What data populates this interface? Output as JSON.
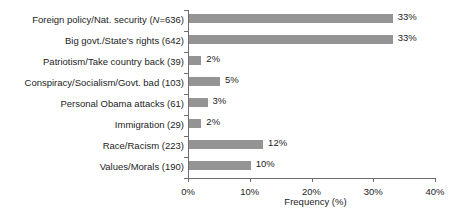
{
  "chart_data": {
    "type": "bar",
    "orientation": "horizontal",
    "title": "",
    "xlabel": "Frequency (%)",
    "ylabel": "",
    "xlim": [
      0,
      40
    ],
    "xticks": [
      "0%",
      "10%",
      "20%",
      "30%",
      "40%"
    ],
    "xtick_values": [
      0,
      10,
      20,
      30,
      40
    ],
    "grid": false,
    "legend": null,
    "bar_color": "#949494",
    "axis_color": "#6e6e6e",
    "text_color": "#1d1d1d",
    "categories": [
      "Foreign policy/Nat. security (N=636)",
      "Big govt./State's rights (642)",
      "Patriotism/Take country back (39)",
      "Conspiracy/Socialism/Govt. bad (103)",
      "Personal Obama attacks (61)",
      "Immigration (29)",
      "Race/Racism (223)",
      "Values/Morals (190)"
    ],
    "values": [
      33,
      33,
      2,
      5,
      3,
      2,
      12,
      10
    ],
    "value_labels": [
      "33%",
      "33%",
      "2%",
      "5%",
      "3%",
      "2%",
      "12%",
      "10%"
    ],
    "counts": [
      636,
      642,
      39,
      103,
      61,
      29,
      223,
      190
    ],
    "rows": [
      {
        "label_pre": "Foreign policy/Nat. security (",
        "label_italic": "N",
        "label_post": "=636)",
        "value": 33,
        "value_label": "33%"
      },
      {
        "label_pre": "Big govt./State's rights (642)",
        "label_italic": "",
        "label_post": "",
        "value": 33,
        "value_label": "33%"
      },
      {
        "label_pre": "Patriotism/Take country back (39)",
        "label_italic": "",
        "label_post": "",
        "value": 2,
        "value_label": "2%"
      },
      {
        "label_pre": "Conspiracy/Socialism/Govt. bad (103)",
        "label_italic": "",
        "label_post": "",
        "value": 5,
        "value_label": "5%"
      },
      {
        "label_pre": "Personal Obama attacks (61)",
        "label_italic": "",
        "label_post": "",
        "value": 3,
        "value_label": "3%"
      },
      {
        "label_pre": "Immigration (29)",
        "label_italic": "",
        "label_post": "",
        "value": 2,
        "value_label": "2%"
      },
      {
        "label_pre": "Race/Racism (223)",
        "label_italic": "",
        "label_post": "",
        "value": 12,
        "value_label": "12%"
      },
      {
        "label_pre": "Values/Morals (190)",
        "label_italic": "",
        "label_post": "",
        "value": 10,
        "value_label": "10%"
      }
    ]
  }
}
